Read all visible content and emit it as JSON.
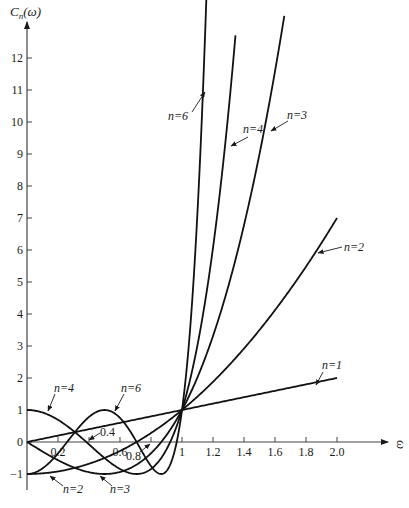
{
  "chart_data": {
    "type": "line",
    "title": "",
    "xlabel": "ω",
    "ylabel": "C_n(ω)",
    "ylabel_main": "C",
    "ylabel_sub": "n",
    "ylabel_arg": "(ω)",
    "xlim": [
      0,
      2.2
    ],
    "ylim": [
      -1.5,
      12.5
    ],
    "grid": false,
    "legend": "none",
    "x_ticks": [
      {
        "value": 0.2,
        "label": "0.2"
      },
      {
        "value": 0.4,
        "label": "0.4"
      },
      {
        "value": 0.6,
        "label": "0.6"
      },
      {
        "value": 0.8,
        "label": "0.8"
      },
      {
        "value": 1.0,
        "label": "1"
      },
      {
        "value": 1.2,
        "label": "1.2"
      },
      {
        "value": 1.4,
        "label": "1.4"
      },
      {
        "value": 1.6,
        "label": "1.6"
      },
      {
        "value": 1.8,
        "label": "1.8"
      },
      {
        "value": 2.0,
        "label": "2.0"
      }
    ],
    "y_ticks": [
      {
        "value": -1,
        "label": "-1"
      },
      {
        "value": 0,
        "label": "0"
      },
      {
        "value": 1,
        "label": "1"
      },
      {
        "value": 2,
        "label": "2"
      },
      {
        "value": 3,
        "label": "3"
      },
      {
        "value": 4,
        "label": "4"
      },
      {
        "value": 5,
        "label": "5"
      },
      {
        "value": 6,
        "label": "6"
      },
      {
        "value": 7,
        "label": "7"
      },
      {
        "value": 8,
        "label": "8"
      },
      {
        "value": 9,
        "label": "9"
      },
      {
        "value": 10,
        "label": "10"
      },
      {
        "value": 11,
        "label": "11"
      },
      {
        "value": 12,
        "label": "12"
      }
    ],
    "series": [
      {
        "name": "n=1",
        "n": 1,
        "formula": "C_1(ω)=ω",
        "x_max": 2.0,
        "points": [
          [
            0,
            0
          ],
          [
            0.5,
            0.5
          ],
          [
            1,
            1
          ],
          [
            1.5,
            1.5
          ],
          [
            2.0,
            2.0
          ]
        ]
      },
      {
        "name": "n=2",
        "n": 2,
        "formula": "C_2(ω)=2ω²−1",
        "x_max": 2.0,
        "points": [
          [
            0,
            -1
          ],
          [
            0.5,
            -0.5
          ],
          [
            1,
            1
          ],
          [
            1.5,
            3.5
          ],
          [
            2.0,
            7.0
          ]
        ]
      },
      {
        "name": "n=3",
        "n": 3,
        "formula": "C_3(ω)=4ω³−3ω",
        "x_max": 1.66,
        "points": [
          [
            0,
            0
          ],
          [
            0.5,
            -1
          ],
          [
            0.866,
            0
          ],
          [
            1,
            1
          ],
          [
            1.5,
            9.0
          ],
          [
            1.66,
            12.0
          ]
        ]
      },
      {
        "name": "n=4",
        "n": 4,
        "formula": "C_4(ω)=8ω⁴−8ω²+1",
        "x_max": 1.345,
        "points": [
          [
            0,
            1
          ],
          [
            0.383,
            0
          ],
          [
            0.707,
            -1
          ],
          [
            0.924,
            0
          ],
          [
            1,
            1
          ],
          [
            1.2,
            6.07
          ],
          [
            1.345,
            11.8
          ]
        ]
      },
      {
        "name": "n=6",
        "n": 6,
        "formula": "C_6(ω)=32ω⁶−48ω⁴+18ω²−1",
        "x_max": 1.172,
        "points": [
          [
            0,
            -1
          ],
          [
            0.259,
            0
          ],
          [
            0.5,
            1
          ],
          [
            0.707,
            0
          ],
          [
            0.866,
            -1
          ],
          [
            0.966,
            0
          ],
          [
            1,
            1
          ],
          [
            1.1,
            4.9
          ],
          [
            1.172,
            12.0
          ]
        ]
      }
    ],
    "annotations": [
      {
        "text": "n=6",
        "series": "n=6",
        "where": "upper branch, left of curve"
      },
      {
        "text": "n=4",
        "series": "n=4",
        "where": "upper branch"
      },
      {
        "text": "n=3",
        "series": "n=3",
        "where": "upper branch, right of curve"
      },
      {
        "text": "n=2",
        "series": "n=2",
        "where": "right side"
      },
      {
        "text": "n=1",
        "series": "n=1",
        "where": "right end"
      },
      {
        "text": "n=4",
        "series": "n=4",
        "where": "near ω=0, C=1"
      },
      {
        "text": "n=6",
        "series": "n=6",
        "where": "near peak at ω=0.5"
      },
      {
        "text": "n=2",
        "series": "n=2",
        "where": "below axis, near ω=0.2"
      },
      {
        "text": "n=3",
        "series": "n=3",
        "where": "below axis, near ω=0.6"
      },
      {
        "text": "0.4",
        "where": "x-tick label with arrow"
      },
      {
        "text": "0.8",
        "where": "x-tick label with arrow"
      }
    ]
  }
}
